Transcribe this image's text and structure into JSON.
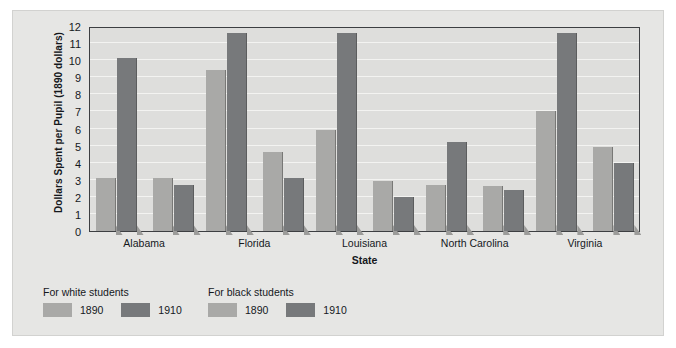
{
  "chart_data": {
    "type": "bar",
    "title": "",
    "xlabel": "State",
    "ylabel": "Dollars Spent per Pupil (1890 dollars)",
    "categories": [
      "Alabama",
      "Florida",
      "Louisiana",
      "North Carolina",
      "Virginia"
    ],
    "series": [
      {
        "name": "For white students 1890",
        "group": "For white students",
        "year": "1890",
        "color": "#a9a9a7",
        "values": [
          3.1,
          9.4,
          5.9,
          2.7,
          7.0
        ]
      },
      {
        "name": "For white students 1910",
        "group": "For white students",
        "year": "1910",
        "color": "#77797b",
        "values": [
          10.1,
          11.6,
          11.6,
          5.2,
          11.6
        ]
      },
      {
        "name": "For black students 1890",
        "group": "For black students",
        "year": "1890",
        "color": "#a9a9a7",
        "values": [
          3.1,
          4.6,
          2.9,
          2.65,
          4.9
        ]
      },
      {
        "name": "For black students 1910",
        "group": "For black students",
        "year": "1910",
        "color": "#77797b",
        "values": [
          2.7,
          3.1,
          2.0,
          2.4,
          4.0
        ]
      }
    ],
    "ylim": [
      0,
      12
    ],
    "ytick_values": [
      0,
      1,
      2,
      3,
      4,
      5,
      6,
      7,
      8,
      9,
      10,
      11,
      12
    ],
    "yticks": [
      "0",
      "1",
      "2",
      "3",
      "4",
      "5",
      "6",
      "7",
      "8",
      "9",
      "10",
      "11",
      "12"
    ],
    "grid": true,
    "legend_position": "below-plot",
    "plot_background": "#dededc",
    "figure_background": "#e6e6e4"
  },
  "legend": {
    "groups": [
      {
        "title": "For white students",
        "entries": [
          {
            "label": "1890",
            "color": "#a9a9a7"
          },
          {
            "label": "1910",
            "color": "#77797b"
          }
        ]
      },
      {
        "title": "For black students",
        "entries": [
          {
            "label": "1890",
            "color": "#a9a9a7"
          },
          {
            "label": "1910",
            "color": "#77797b"
          }
        ]
      }
    ]
  }
}
